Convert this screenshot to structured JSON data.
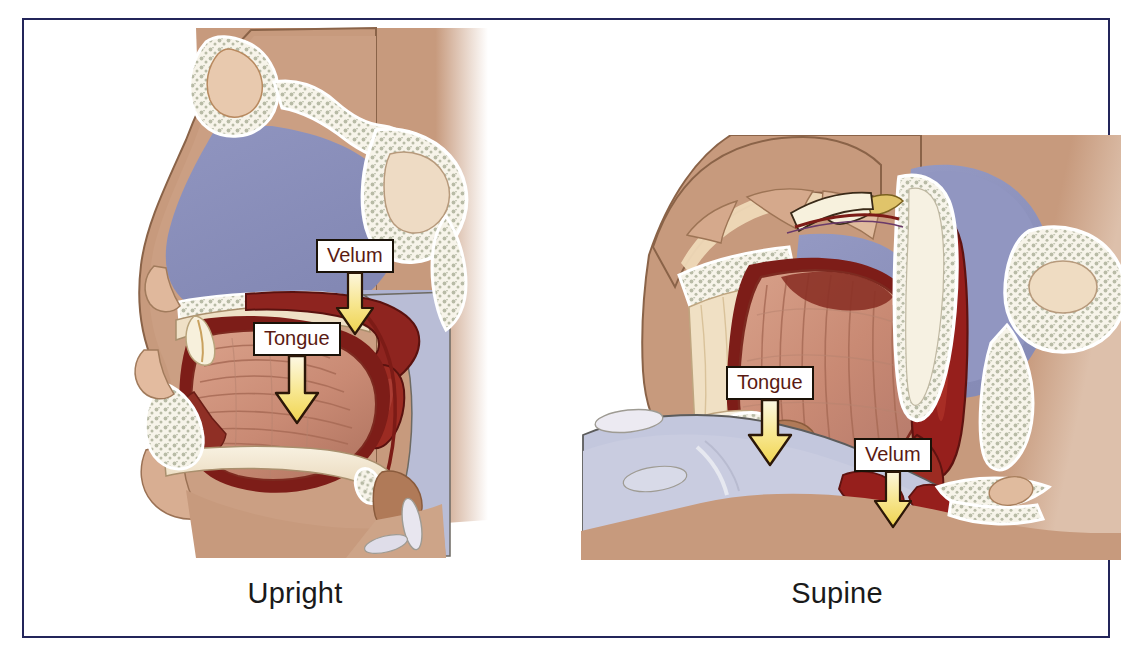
{
  "figure": {
    "border_color": "#23255a",
    "background": "#ffffff"
  },
  "panels": [
    {
      "id": "upright",
      "caption": "Upright",
      "callouts": [
        {
          "label": "Velum",
          "arrow": "down-arrow-icon"
        },
        {
          "label": "Tongue",
          "arrow": "down-arrow-icon"
        }
      ]
    },
    {
      "id": "supine",
      "caption": "Supine",
      "callouts": [
        {
          "label": "Tongue",
          "arrow": "down-arrow-icon"
        },
        {
          "label": "Velum",
          "arrow": "down-arrow-icon"
        }
      ]
    }
  ],
  "colors": {
    "frame_navy": "#23255a",
    "skin_tan": "#c79a7d",
    "skin_tan_light": "#d6ab8d",
    "airway_blue": "#8b8fba",
    "airway_blue_light": "#c3c7dd",
    "bone_cream": "#f3e6cf",
    "bone_white": "#f7f4ea",
    "cartilage_gray": "#b8bba6",
    "muscle_salmon": "#c98a74",
    "muscle_dark": "#8f2f25",
    "vessel_red": "#961f1c",
    "soft_palate_red": "#8e241f",
    "arrow_yellow": "#f5e27a",
    "arrow_outline": "#2b1708",
    "label_text": "#5a1a12",
    "caption_text": "#1a1a1a"
  },
  "structures": {
    "upright": [
      "nasal-cavity",
      "frontal-sinus",
      "sphenoid-sinus",
      "hard-palate",
      "soft-palate-velum",
      "tongue",
      "mandible",
      "hyoid",
      "epiglottis",
      "oropharynx",
      "cervical-spine"
    ],
    "supine": [
      "nasal-cavity",
      "hard-palate",
      "soft-palate-velum",
      "tongue",
      "mandible",
      "hyoid",
      "epiglottis",
      "oropharynx",
      "sphenoid-sinus",
      "cervical-spine"
    ]
  }
}
